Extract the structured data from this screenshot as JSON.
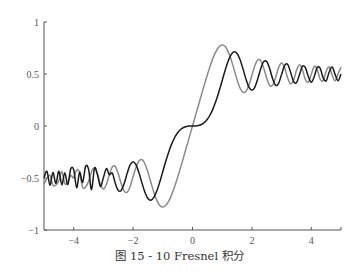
{
  "caption": "图 15 - 10   Fresnel 积分",
  "chart_data": {
    "type": "line",
    "xlabel": "",
    "ylabel": "",
    "xlim": [
      -5,
      5
    ],
    "ylim": [
      -1,
      1
    ],
    "grid": false,
    "legend": null,
    "xticks": [
      -4,
      -2,
      0,
      2,
      4
    ],
    "yticks": [
      -1,
      -0.5,
      0,
      0.5,
      1
    ],
    "xtick_labels": [
      "−4",
      "−2",
      "0",
      "2",
      "4"
    ],
    "ytick_labels": [
      "−1",
      "−0.5",
      "0",
      "0.5",
      "1"
    ],
    "x": [
      -5.0,
      -4.9,
      -4.8,
      -4.7,
      -4.6,
      -4.5,
      -4.4,
      -4.3,
      -4.2,
      -4.1,
      -4.0,
      -3.9,
      -3.8,
      -3.7,
      -3.6,
      -3.5,
      -3.4,
      -3.3,
      -3.2,
      -3.1,
      -3.0,
      -2.9,
      -2.8,
      -2.7,
      -2.6,
      -2.5,
      -2.4,
      -2.3,
      -2.2,
      -2.1,
      -2.0,
      -1.9,
      -1.8,
      -1.7,
      -1.6,
      -1.5,
      -1.4,
      -1.3,
      -1.2,
      -1.1,
      -1.0,
      -0.9,
      -0.8,
      -0.7,
      -0.6,
      -0.5,
      -0.4,
      -0.3,
      -0.2,
      -0.1,
      0.0,
      0.1,
      0.2,
      0.3,
      0.4,
      0.5,
      0.6,
      0.7,
      0.8,
      0.9,
      1.0,
      1.1,
      1.2,
      1.3,
      1.4,
      1.5,
      1.6,
      1.7,
      1.8,
      1.9,
      2.0,
      2.1,
      2.2,
      2.3,
      2.4,
      2.5,
      2.6,
      2.7,
      2.8,
      2.9,
      3.0,
      3.1,
      3.2,
      3.3,
      3.4,
      3.5,
      3.6,
      3.7,
      3.8,
      3.9,
      4.0,
      4.1,
      4.2,
      4.3,
      4.4,
      4.5,
      4.6,
      4.7,
      4.8,
      4.9,
      5.0
    ],
    "series": [
      {
        "name": "S(x) = ∫ sin(πt²/2) dt",
        "color": "#1a1a1a",
        "values": [
          -0.4992,
          -0.4357,
          -0.5693,
          -0.4474,
          -0.5516,
          -0.4342,
          -0.5651,
          -0.4492,
          -0.5631,
          -0.4125,
          -0.4205,
          -0.5923,
          -0.4455,
          -0.5424,
          -0.3883,
          -0.4153,
          -0.6135,
          -0.4058,
          -0.4663,
          -0.5815,
          -0.4963,
          -0.4101,
          -0.4676,
          -0.4529,
          -0.55,
          -0.6192,
          -0.6197,
          -0.5532,
          -0.4557,
          -0.3745,
          -0.3434,
          -0.3733,
          -0.4509,
          -0.5492,
          -0.6389,
          -0.6975,
          -0.7135,
          -0.6863,
          -0.6234,
          -0.5365,
          -0.4383,
          -0.3398,
          -0.2492,
          -0.1721,
          -0.1105,
          -0.0647,
          -0.0334,
          -0.0141,
          -0.0042,
          -0.0005,
          0.0,
          0.0005,
          0.0042,
          0.0141,
          0.0334,
          0.0647,
          0.1105,
          0.1721,
          0.2492,
          0.3398,
          0.4383,
          0.5365,
          0.6234,
          0.6863,
          0.7135,
          0.6975,
          0.6389,
          0.5492,
          0.4509,
          0.3733,
          0.3434,
          0.3745,
          0.4557,
          0.5532,
          0.6197,
          0.6192,
          0.55,
          0.4529,
          0.3915,
          0.4101,
          0.4963,
          0.5815,
          0.5933,
          0.5193,
          0.4297,
          0.4153,
          0.4923,
          0.575,
          0.561,
          0.4752,
          0.4205,
          0.4758,
          0.5632,
          0.554,
          0.4623,
          0.4342,
          0.5162,
          0.5672,
          0.4968,
          0.4351,
          0.4992
        ]
      },
      {
        "name": "C(x) = ∫ cos(πt²/2) dt",
        "color": "#8a8a8a",
        "values": [
          -0.5636,
          -0.5,
          -0.4766,
          -0.5677,
          -0.5672,
          -0.5261,
          -0.4383,
          -0.5525,
          -0.5417,
          -0.4758,
          -0.4984,
          -0.4228,
          -0.4481,
          -0.588,
          -0.588,
          -0.5326,
          -0.4383,
          -0.4058,
          -0.4663,
          -0.5616,
          -0.6057,
          -0.5625,
          -0.4675,
          -0.3925,
          -0.3889,
          -0.4574,
          -0.555,
          -0.6266,
          -0.6363,
          -0.5816,
          -0.4883,
          -0.3943,
          -0.3336,
          -0.3238,
          -0.3655,
          -0.4453,
          -0.5431,
          -0.6386,
          -0.7154,
          -0.7638,
          -0.7799,
          -0.7648,
          -0.7228,
          -0.6597,
          -0.5811,
          -0.4923,
          -0.3975,
          -0.2994,
          -0.1999,
          -0.1,
          0.0,
          0.1,
          0.1999,
          0.2994,
          0.3975,
          0.4923,
          0.5811,
          0.6597,
          0.7228,
          0.7648,
          0.7799,
          0.7638,
          0.7154,
          0.6386,
          0.5431,
          0.4453,
          0.3655,
          0.3238,
          0.3336,
          0.3943,
          0.4883,
          0.5816,
          0.6363,
          0.6266,
          0.555,
          0.4574,
          0.3889,
          0.3925,
          0.4675,
          0.5625,
          0.6057,
          0.5616,
          0.4663,
          0.4058,
          0.4385,
          0.5326,
          0.588,
          0.542,
          0.4481,
          0.4223,
          0.4984,
          0.5738,
          0.5417,
          0.4494,
          0.4383,
          0.5261,
          0.5672,
          0.4914,
          0.4338,
          0.5002,
          0.5636
        ]
      }
    ]
  },
  "plot_box": {
    "left": 44,
    "right": 341,
    "top": 22,
    "bottom": 230
  }
}
